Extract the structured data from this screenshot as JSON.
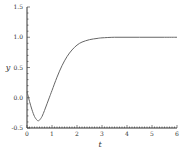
{
  "chart_data": {
    "type": "line",
    "title": "",
    "xlabel": "t",
    "ylabel": "y",
    "xlim": [
      0,
      6
    ],
    "ylim": [
      -0.5,
      1.5
    ],
    "x_ticks": [
      "0",
      "1",
      "2",
      "3",
      "4",
      "5",
      "6"
    ],
    "y_ticks": [
      "-0.5",
      "0.0",
      "0.5",
      "1.0",
      "1.5"
    ],
    "grid": false,
    "legend": null,
    "series": [
      {
        "name": "y(t)",
        "color": "#666666",
        "x": [
          0,
          0.1,
          0.2,
          0.3,
          0.4,
          0.45,
          0.5,
          0.6,
          0.7,
          0.8,
          0.9,
          1.0,
          1.2,
          1.4,
          1.6,
          1.8,
          2.0,
          2.2,
          2.5,
          2.8,
          3.0,
          3.5,
          4.0,
          4.5,
          5.0,
          5.5,
          6.0
        ],
        "values": [
          0.1,
          -0.06,
          -0.2,
          -0.31,
          -0.37,
          -0.38,
          -0.37,
          -0.31,
          -0.21,
          -0.1,
          0.01,
          0.12,
          0.34,
          0.53,
          0.68,
          0.79,
          0.87,
          0.92,
          0.96,
          0.98,
          0.99,
          1.0,
          1.0,
          1.0,
          1.0,
          1.0,
          1.0
        ]
      }
    ]
  },
  "labels": {
    "x_axis": "t",
    "y_axis": "y"
  }
}
